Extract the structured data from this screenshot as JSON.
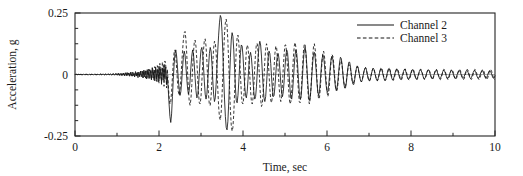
{
  "chart_data": {
    "type": "line",
    "title": "",
    "subtitle": "",
    "xlabel": "Time, sec",
    "ylabel": "Acceleration, g",
    "xlim": [
      0,
      10
    ],
    "ylim": [
      -0.25,
      0.25
    ],
    "xticks": [
      0,
      2,
      4,
      6,
      8,
      10
    ],
    "xtick_labels": [
      "0",
      "2",
      "4",
      "6",
      "8",
      "10"
    ],
    "xminor_step": 1,
    "yticks": [
      -0.25,
      0,
      0.25
    ],
    "ytick_labels": [
      "-0.25",
      "0",
      "0.25"
    ],
    "yminor_step": 0.0625,
    "grid": false,
    "zero_line": true,
    "legend_position": "top-right",
    "legend": [
      {
        "name": "Channel 2",
        "style": "solid"
      },
      {
        "name": "Channel 3",
        "style": "dashed"
      }
    ],
    "sample_interval_sec": 0.02,
    "series": [
      {
        "name": "Channel 2",
        "style": "solid",
        "x_start": 0,
        "dx": 0.02,
        "values": [
          0.0,
          0.001,
          0.0,
          -0.001,
          0.001,
          0.0,
          -0.001,
          0.001,
          0.0,
          -0.001,
          0.001,
          0.0,
          -0.001,
          0.0,
          0.001,
          0.0,
          -0.001,
          0.001,
          0.0,
          -0.001,
          0.001,
          0.0,
          -0.001,
          0.001,
          0.0,
          -0.001,
          0.0,
          0.001,
          0.0,
          -0.001,
          0.002,
          0.0,
          -0.002,
          0.002,
          0.001,
          -0.002,
          0.002,
          0.0,
          -0.002,
          0.002,
          0.001,
          -0.002,
          0.003,
          0.0,
          -0.003,
          0.003,
          0.001,
          -0.003,
          0.003,
          0.0,
          0.004,
          -0.003,
          0.005,
          -0.002,
          0.004,
          -0.004,
          0.005,
          -0.003,
          0.006,
          -0.004,
          0.007,
          -0.005,
          0.008,
          -0.004,
          0.006,
          -0.007,
          0.009,
          -0.005,
          0.01,
          -0.006,
          0.004,
          -0.01,
          0.012,
          -0.006,
          0.008,
          -0.013,
          0.01,
          -0.008,
          0.014,
          -0.009,
          0.012,
          -0.014,
          0.018,
          -0.01,
          0.015,
          -0.018,
          0.02,
          -0.012,
          0.022,
          -0.016,
          0.014,
          -0.022,
          0.026,
          -0.014,
          0.018,
          -0.026,
          0.03,
          -0.018,
          0.02,
          -0.03,
          0.034,
          -0.016,
          0.022,
          -0.034,
          0.026,
          -0.022,
          0.038,
          -0.02,
          0.03,
          -0.04,
          -0.01,
          -0.06,
          -0.12,
          -0.17,
          -0.195,
          -0.16,
          -0.09,
          -0.02,
          0.04,
          0.085,
          0.1,
          0.075,
          0.03,
          -0.02,
          -0.06,
          -0.085,
          -0.07,
          -0.03,
          0.025,
          0.07,
          0.095,
          0.08,
          0.035,
          -0.015,
          -0.055,
          -0.08,
          -0.065,
          -0.025,
          0.03,
          0.075,
          0.1,
          0.085,
          0.04,
          -0.015,
          -0.065,
          -0.095,
          -0.09,
          -0.05,
          0.005,
          0.06,
          0.1,
          0.11,
          0.085,
          0.03,
          -0.03,
          -0.08,
          -0.1,
          -0.08,
          -0.03,
          0.03,
          0.085,
          0.11,
          0.095,
          0.045,
          -0.02,
          -0.08,
          -0.11,
          -0.095,
          -0.04,
          0.03,
          0.1,
          0.16,
          0.21,
          0.24,
          0.23,
          0.175,
          0.09,
          -0.01,
          -0.1,
          -0.17,
          -0.215,
          -0.225,
          -0.19,
          -0.115,
          -0.02,
          0.07,
          0.14,
          0.17,
          0.155,
          0.1,
          0.02,
          -0.055,
          -0.105,
          -0.115,
          -0.085,
          -0.03,
          0.035,
          0.09,
          0.12,
          0.115,
          0.075,
          0.015,
          -0.045,
          -0.085,
          -0.095,
          -0.07,
          -0.02,
          0.035,
          0.075,
          0.09,
          0.07,
          0.025,
          -0.03,
          -0.075,
          -0.1,
          -0.09,
          -0.05,
          0.01,
          0.07,
          0.115,
          0.135,
          0.12,
          0.075,
          0.01,
          -0.05,
          -0.095,
          -0.11,
          -0.09,
          -0.04,
          0.02,
          0.07,
          0.095,
          0.085,
          0.045,
          -0.01,
          -0.06,
          -0.09,
          -0.085,
          -0.05,
          0.0,
          0.05,
          0.08,
          0.085,
          0.06,
          0.015,
          -0.035,
          -0.075,
          -0.09,
          -0.07,
          -0.025,
          0.03,
          0.075,
          0.1,
          0.09,
          0.05,
          -0.005,
          -0.06,
          -0.095,
          -0.1,
          -0.07,
          -0.02,
          0.035,
          0.08,
          0.1,
          0.085,
          0.04,
          -0.02,
          -0.07,
          -0.1,
          -0.095,
          -0.055,
          0.005,
          0.06,
          0.1,
          0.11,
          0.085,
          0.035,
          -0.025,
          -0.075,
          -0.105,
          -0.095,
          -0.055,
          0.0,
          0.05,
          0.085,
          0.09,
          0.065,
          0.02,
          -0.03,
          -0.07,
          -0.085,
          -0.07,
          -0.03,
          0.02,
          0.06,
          0.08,
          0.07,
          0.04,
          -0.005,
          -0.045,
          -0.07,
          -0.07,
          -0.045,
          -0.005,
          0.035,
          0.065,
          0.075,
          0.06,
          0.025,
          -0.015,
          -0.05,
          -0.065,
          -0.055,
          -0.025,
          0.015,
          0.05,
          0.07,
          0.065,
          0.04,
          0.0,
          -0.035,
          -0.055,
          -0.055,
          -0.035,
          0.0,
          0.03,
          0.05,
          0.05,
          0.03,
          0.0,
          -0.025,
          -0.04,
          -0.04,
          -0.02,
          0.005,
          0.025,
          0.035,
          0.03,
          0.01,
          -0.01,
          -0.025,
          -0.03,
          -0.022,
          -0.005,
          0.012,
          0.025,
          0.028,
          0.018,
          0.0,
          -0.015,
          -0.025,
          -0.025,
          -0.012,
          0.005,
          0.018,
          0.025,
          0.02,
          0.005,
          -0.01,
          -0.022,
          -0.025,
          -0.015,
          0.0,
          0.015,
          0.025,
          0.022,
          0.01,
          -0.005,
          -0.018,
          -0.025,
          -0.02,
          -0.005,
          0.01,
          0.022,
          0.025,
          0.015,
          0.0,
          -0.014,
          -0.022,
          -0.02,
          -0.008,
          0.006,
          0.018,
          0.023,
          0.018,
          0.005,
          -0.008,
          -0.018,
          -0.02,
          -0.012,
          0.0,
          0.012,
          0.02,
          0.02,
          0.01,
          -0.004,
          -0.015,
          -0.02,
          -0.016,
          -0.004,
          0.008,
          0.018,
          0.02,
          0.014,
          0.002,
          -0.01,
          -0.018,
          -0.018,
          -0.01,
          0.002,
          0.013,
          0.019,
          0.017,
          0.008,
          -0.004,
          -0.014,
          -0.018,
          -0.013,
          -0.002,
          0.01,
          0.017,
          0.018,
          0.012,
          0.0,
          -0.01,
          -0.017,
          -0.015,
          -0.006,
          0.006,
          0.015,
          0.018,
          0.013,
          0.002,
          -0.008,
          -0.016,
          -0.016,
          -0.008,
          0.003,
          0.013,
          0.018,
          0.014,
          0.004,
          -0.007,
          -0.015,
          -0.016,
          -0.009,
          0.002,
          0.012,
          0.017,
          0.014,
          0.005,
          -0.006,
          -0.014,
          -0.016,
          -0.01,
          0.0,
          0.01,
          0.016,
          0.015,
          0.007,
          -0.004,
          -0.013,
          -0.016,
          -0.011,
          -0.001,
          0.009,
          0.016,
          0.016,
          0.008,
          -0.003,
          -0.012,
          -0.016,
          -0.012,
          -0.002,
          0.008,
          0.015,
          0.016,
          0.009,
          -0.002,
          -0.011,
          -0.016,
          -0.013,
          -0.003,
          0.007,
          0.014,
          0.016,
          0.01,
          0.0,
          -0.01,
          -0.015,
          -0.013,
          -0.004,
          0.006,
          0.014,
          0.016,
          0.011,
          0.001,
          -0.009,
          -0.015,
          -0.014,
          -0.005,
          0.005,
          0.013,
          0.016,
          0.011,
          0.002,
          -0.008,
          -0.015,
          -0.014,
          -0.006
        ]
      },
      {
        "name": "Channel 3",
        "style": "dashed",
        "x_start": 0,
        "dx": 0.02,
        "values": [
          0.0,
          0.0,
          0.001,
          0.0,
          -0.001,
          0.0,
          0.001,
          0.0,
          -0.001,
          0.0,
          0.001,
          -0.001,
          0.0,
          0.001,
          0.0,
          -0.001,
          0.0,
          0.001,
          -0.001,
          0.0,
          0.001,
          0.0,
          -0.001,
          0.0,
          0.001,
          0.0,
          -0.001,
          0.0,
          0.001,
          -0.001,
          0.001,
          0.002,
          -0.001,
          0.001,
          0.002,
          -0.002,
          0.001,
          0.002,
          -0.002,
          0.001,
          0.002,
          -0.002,
          0.002,
          0.003,
          -0.002,
          0.002,
          0.003,
          -0.003,
          0.002,
          0.003,
          -0.003,
          0.004,
          0.002,
          -0.004,
          0.004,
          0.003,
          -0.004,
          0.005,
          0.003,
          -0.005,
          0.005,
          0.004,
          -0.006,
          0.006,
          0.004,
          -0.006,
          0.007,
          0.005,
          -0.007,
          0.008,
          0.005,
          -0.008,
          0.009,
          0.006,
          -0.009,
          0.01,
          0.007,
          -0.01,
          0.011,
          0.008,
          0.014,
          -0.012,
          0.016,
          0.01,
          -0.014,
          0.018,
          0.012,
          -0.016,
          0.02,
          0.014,
          0.022,
          -0.02,
          0.028,
          0.016,
          -0.024,
          0.032,
          0.02,
          -0.028,
          0.036,
          0.022,
          -0.035,
          0.045,
          0.03,
          -0.04,
          0.05,
          0.035,
          -0.048,
          0.055,
          0.04,
          -0.055,
          0.02,
          -0.04,
          -0.09,
          -0.12,
          -0.11,
          -0.07,
          -0.01,
          0.05,
          0.09,
          0.1,
          0.075,
          0.025,
          -0.03,
          -0.07,
          -0.085,
          -0.065,
          -0.02,
          0.04,
          0.095,
          0.14,
          0.17,
          0.175,
          0.145,
          0.085,
          0.01,
          -0.06,
          -0.11,
          -0.125,
          -0.1,
          -0.045,
          0.025,
          0.09,
          0.13,
          0.14,
          0.115,
          0.06,
          -0.01,
          -0.075,
          -0.115,
          -0.12,
          -0.09,
          -0.03,
          0.04,
          0.1,
          0.14,
          0.145,
          0.115,
          0.055,
          -0.02,
          -0.085,
          -0.125,
          -0.125,
          -0.09,
          -0.025,
          0.045,
          0.105,
          0.135,
          0.13,
          0.09,
          0.02,
          -0.06,
          -0.13,
          -0.175,
          -0.185,
          -0.155,
          -0.09,
          0.0,
          0.09,
          0.165,
          0.21,
          0.225,
          0.2,
          0.135,
          0.045,
          -0.055,
          -0.145,
          -0.205,
          -0.23,
          -0.215,
          -0.16,
          -0.075,
          0.02,
          0.1,
          0.15,
          0.16,
          0.13,
          0.07,
          -0.005,
          -0.075,
          -0.115,
          -0.12,
          -0.09,
          -0.03,
          0.04,
          0.095,
          0.12,
          0.11,
          0.065,
          0.0,
          -0.065,
          -0.11,
          -0.12,
          -0.095,
          -0.04,
          0.03,
          0.09,
          0.125,
          0.125,
          0.09,
          0.03,
          -0.04,
          -0.1,
          -0.13,
          -0.12,
          -0.075,
          -0.01,
          0.055,
          0.105,
          0.125,
          0.11,
          0.065,
          0.0,
          -0.06,
          -0.105,
          -0.115,
          -0.09,
          -0.035,
          0.03,
          0.085,
          0.115,
          0.11,
          0.07,
          0.01,
          -0.05,
          -0.095,
          -0.11,
          -0.09,
          -0.035,
          0.03,
          0.085,
          0.12,
          0.12,
          0.085,
          0.025,
          -0.04,
          -0.095,
          -0.12,
          -0.11,
          -0.065,
          0.005,
          0.07,
          0.115,
          0.13,
          0.11,
          0.06,
          -0.01,
          -0.07,
          -0.11,
          -0.115,
          -0.085,
          -0.025,
          0.04,
          0.095,
          0.125,
          0.12,
          0.08,
          0.015,
          -0.05,
          -0.1,
          -0.12,
          -0.1,
          -0.05,
          0.015,
          0.075,
          0.115,
          0.125,
          0.1,
          0.05,
          -0.015,
          -0.07,
          -0.1,
          -0.095,
          -0.06,
          -0.005,
          0.05,
          0.085,
          0.095,
          0.075,
          0.03,
          -0.025,
          -0.07,
          -0.09,
          -0.075,
          -0.035,
          0.015,
          0.06,
          0.08,
          0.075,
          0.045,
          0.0,
          -0.04,
          -0.065,
          -0.065,
          -0.04,
          0.0,
          0.035,
          0.055,
          0.055,
          0.035,
          0.0,
          -0.03,
          -0.048,
          -0.048,
          -0.028,
          0.0,
          0.025,
          0.04,
          0.038,
          0.02,
          -0.005,
          -0.025,
          -0.035,
          -0.03,
          -0.012,
          0.008,
          0.025,
          0.032,
          0.025,
          0.008,
          -0.01,
          -0.025,
          -0.03,
          -0.022,
          -0.005,
          0.012,
          0.025,
          0.028,
          0.018,
          0.0,
          -0.015,
          -0.026,
          -0.024,
          -0.012,
          0.004,
          0.018,
          0.026,
          0.022,
          0.008,
          -0.008,
          -0.02,
          -0.026,
          -0.018,
          -0.003,
          0.012,
          0.024,
          0.026,
          0.016,
          0.0,
          -0.014,
          -0.024,
          -0.022,
          -0.01,
          0.004,
          0.018,
          0.025,
          0.02,
          0.006,
          -0.008,
          -0.02,
          -0.024,
          -0.015,
          -0.002,
          0.012,
          0.022,
          0.023,
          0.014,
          0.0,
          -0.013,
          -0.022,
          -0.02,
          -0.008,
          0.006,
          0.018,
          0.023,
          0.017,
          0.004,
          -0.01,
          -0.02,
          -0.022,
          -0.012,
          0.002,
          0.015,
          0.022,
          0.019,
          0.008,
          -0.005,
          -0.017,
          -0.022,
          -0.015,
          -0.002,
          0.012,
          0.021,
          0.021,
          0.012,
          -0.001,
          -0.014,
          -0.021,
          -0.017,
          -0.006,
          0.008,
          0.018,
          0.022,
          0.016,
          0.004,
          -0.01,
          -0.02,
          -0.019,
          -0.009,
          0.004,
          0.016,
          0.022,
          0.018,
          0.007,
          -0.006,
          -0.018,
          -0.021,
          -0.013,
          -0.001,
          0.013,
          0.021,
          0.019,
          0.01,
          -0.003,
          -0.015,
          -0.021,
          -0.016,
          -0.004,
          0.01,
          0.02,
          0.02,
          0.012,
          0.0,
          -0.013,
          -0.02,
          -0.017,
          -0.007,
          0.007,
          0.018,
          0.021,
          0.014,
          0.002,
          -0.011,
          -0.02,
          -0.019,
          -0.01,
          0.004,
          0.016,
          0.021,
          0.016,
          0.005,
          -0.008,
          -0.018,
          -0.02,
          -0.012,
          0.0,
          0.013,
          0.021,
          0.018,
          0.008,
          -0.005,
          -0.016,
          -0.021,
          -0.015,
          -0.003,
          0.011,
          0.02,
          0.019,
          0.011,
          -0.002,
          -0.014,
          -0.021,
          -0.017,
          -0.006,
          0.008,
          0.018,
          0.02,
          0.013,
          0.001,
          -0.012,
          -0.02,
          -0.019,
          -0.009,
          0.005,
          0.016,
          0.021,
          0.015,
          0.003,
          -0.01,
          -0.019,
          -0.02
        ]
      }
    ]
  },
  "plot_geometry": {
    "left": 75,
    "right": 495,
    "top": 13,
    "bottom": 136
  },
  "legend_geometry": {
    "line_x1": 357,
    "line_x2": 394,
    "text_x": 400,
    "row1_y": 25,
    "row2_y": 38
  }
}
